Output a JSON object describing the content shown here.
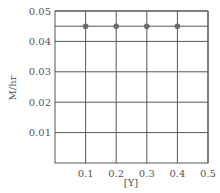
{
  "chart_data": {
    "type": "scatter",
    "title": "",
    "xlabel": "[Y]",
    "ylabel": "M/hr",
    "xlim": [
      0,
      0.5
    ],
    "ylim": [
      0,
      0.05
    ],
    "x_ticks": [
      "0.1",
      "0.2",
      "0.3",
      "0.4",
      "0.5"
    ],
    "y_ticks": [
      "0.01",
      "0.02",
      "0.03",
      "0.04",
      "0.05"
    ],
    "grid": true,
    "series": [
      {
        "name": "rate",
        "x": [
          0.1,
          0.2,
          0.3,
          0.4
        ],
        "y": [
          0.045,
          0.045,
          0.045,
          0.045
        ]
      }
    ],
    "reference_line": {
      "y": 0.045
    },
    "colors": {
      "grid": "#555555",
      "point": "#6b6b6b",
      "text": "#555555"
    }
  }
}
